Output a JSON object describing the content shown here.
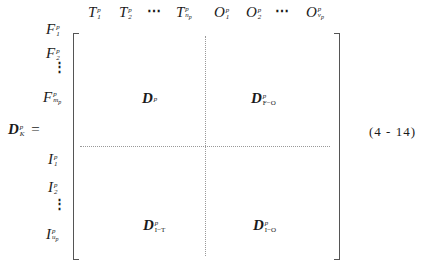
{
  "equation": {
    "lhs": {
      "symbol": "D",
      "sup": "p",
      "sub": "K",
      "equals": "="
    },
    "number": "(4 - 14)",
    "column_headers": [
      {
        "base": "T",
        "sup": "p",
        "sub": "1"
      },
      {
        "base": "T",
        "sup": "p",
        "sub": "2"
      },
      {
        "ellipsis": "⋯"
      },
      {
        "base": "T",
        "sup": "p",
        "sub": "n",
        "subsub": "p"
      },
      {
        "base": "O",
        "sup": "p",
        "sub": "1"
      },
      {
        "base": "O",
        "sup": "p",
        "sub": "2"
      },
      {
        "ellipsis": "⋯"
      },
      {
        "base": "O",
        "sup": "p",
        "sub": "v",
        "subsub": "p"
      }
    ],
    "row_labels": [
      {
        "base": "F",
        "sup": "p",
        "sub": "1"
      },
      {
        "base": "F",
        "sup": "p",
        "sub": "2"
      },
      {
        "ellipsis": "⋮"
      },
      {
        "base": "F",
        "sup": "p",
        "sub": "m",
        "subsub": "p"
      },
      {
        "base": "I",
        "sup": "p",
        "sub": "1"
      },
      {
        "base": "I",
        "sup": "p",
        "sub": "2"
      },
      {
        "ellipsis": "⋮"
      },
      {
        "base": "I",
        "sup": "p",
        "sub": "u",
        "subsub": "p"
      }
    ],
    "blocks": {
      "top_left": {
        "symbol": "D",
        "sup": "p",
        "sub": ""
      },
      "top_right": {
        "symbol": "D",
        "sup": "p",
        "sub": "F−O"
      },
      "bottom_left": {
        "symbol": "D",
        "sup": "p",
        "sub": "I−T"
      },
      "bottom_right": {
        "symbol": "D",
        "sup": "p",
        "sub": "I−O"
      }
    }
  }
}
